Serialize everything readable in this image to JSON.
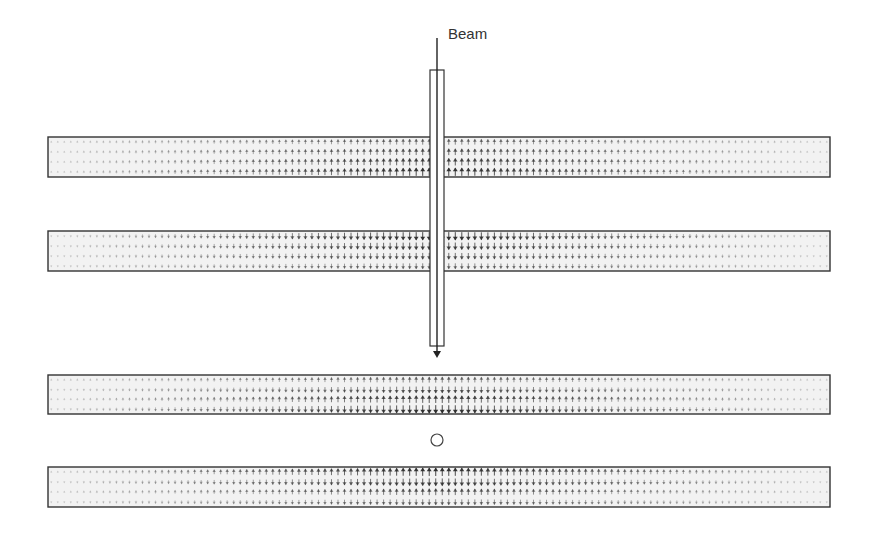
{
  "diagram": {
    "title": "",
    "beam_label": "Beam",
    "colors": {
      "outline": "#333333",
      "arrow": "#2a2a2a",
      "plate_fill": "#f2f2f2",
      "background": "#ffffff"
    },
    "plates": [
      {
        "id": "upper-pair-top",
        "x": 48,
        "y": 137,
        "w": 782,
        "h": 40,
        "field_direction": "up",
        "strong_edge": "bottom"
      },
      {
        "id": "upper-pair-bottom",
        "x": 48,
        "y": 231,
        "w": 782,
        "h": 40,
        "field_direction": "down",
        "strong_edge": "top"
      },
      {
        "id": "lower-pair-top",
        "x": 48,
        "y": 375,
        "w": 782,
        "h": 39,
        "field_direction": "bidirectional",
        "strong_edge": "bottom"
      },
      {
        "id": "lower-pair-bottom",
        "x": 48,
        "y": 467,
        "w": 782,
        "h": 40,
        "field_direction": "bidirectional",
        "strong_edge": "top"
      }
    ],
    "beam_pipe": {
      "x": 430,
      "y_top": 70,
      "y_bottom": 346,
      "width": 14
    },
    "beam_line": {
      "x": 437,
      "y_start": 38,
      "y_end": 358
    },
    "beam_label_pos": {
      "x": 448,
      "y": 42
    },
    "particle": {
      "cx": 437,
      "cy": 440,
      "r": 6
    },
    "arrow_field": {
      "columns": 120,
      "rows": 4
    }
  }
}
